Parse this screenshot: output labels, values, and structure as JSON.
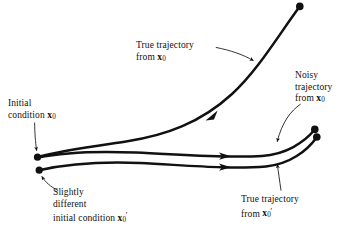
{
  "figure": {
    "background_color": "#ffffff",
    "ink_color": "#111111",
    "width": 347,
    "height": 230
  },
  "labels": {
    "initial_condition": {
      "line1": "Initial",
      "line2_prefix": "condition ",
      "line2_var": "x",
      "line2_sub": "0"
    },
    "true_trajectory_x0": {
      "line1": "True trajectory",
      "line2_prefix": "from ",
      "line2_var": "x",
      "line2_sub": "0"
    },
    "noisy_trajectory": {
      "line1": "Noisy",
      "line2": "trajectory",
      "line3_prefix": "from ",
      "line3_var": "x",
      "line3_sub": "0"
    },
    "slightly_different": {
      "line1": "Slightly",
      "line2": "different",
      "line3_prefix": "initial  condition ",
      "line3_var": "x",
      "line3_sub": "0",
      "line3_prime": "′"
    },
    "true_trajectory_x0_prime": {
      "line1": "True trajectory",
      "line2_prefix": "from ",
      "line2_var": "x",
      "line2_sub": "0",
      "line2_prime": "′"
    }
  },
  "curves": {
    "true_trajectory_x0": {
      "name": "true-trajectory-from-x0",
      "description": "diverging trajectory rising steeply to upper right",
      "start_point": [
        37,
        157
      ],
      "end_point": [
        300,
        6
      ],
      "arrow_marker_at": [
        212,
        115
      ]
    },
    "noisy_trajectory_x0": {
      "name": "noisy-trajectory-from-x0",
      "description": "near-horizontal trajectory ending upper right pair",
      "start_point": [
        37,
        157
      ],
      "end_point": [
        315,
        129
      ],
      "arrow_marker_at": [
        226,
        156
      ]
    },
    "true_trajectory_x0_prime": {
      "name": "true-trajectory-from-x0-prime",
      "description": "near-horizontal trajectory from perturbed start",
      "start_point": [
        39,
        170
      ],
      "end_point": [
        317,
        137
      ],
      "arrow_marker_at": [
        226,
        167
      ]
    }
  },
  "markers": {
    "dots": [
      {
        "name": "initial-condition-dot",
        "x": 37,
        "y": 157
      },
      {
        "name": "perturbed-initial-condition-dot",
        "x": 39,
        "y": 170
      },
      {
        "name": "true-trajectory-endpoint-dot",
        "x": 300,
        "y": 6
      },
      {
        "name": "noisy-trajectory-endpoint-dot",
        "x": 315,
        "y": 129
      },
      {
        "name": "perturbed-trajectory-endpoint-dot",
        "x": 317,
        "y": 137
      }
    ]
  }
}
